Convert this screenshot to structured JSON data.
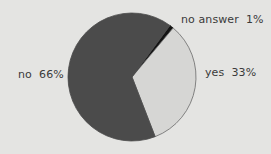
{
  "chart_data": {
    "type": "pie",
    "title": "",
    "categories": [
      "no answer",
      "yes",
      "no"
    ],
    "values": [
      1,
      33,
      66
    ],
    "unit": "%",
    "slices": [
      {
        "label": "no answer",
        "value": 1,
        "display": "no answer  1%",
        "color": "#141414"
      },
      {
        "label": "yes",
        "value": 33,
        "display": "yes  33%",
        "color": "#d6d6d4"
      },
      {
        "label": "no",
        "value": 66,
        "display": "no  66%",
        "color": "#4b4b4b"
      }
    ],
    "start_angle_deg": 36.4,
    "direction": "clockwise",
    "legend": "none (labels placed beside slices)"
  },
  "colors": {
    "background": "#e4e4e2",
    "outline": "#6a6a6a",
    "text": "#3a3a3a"
  }
}
